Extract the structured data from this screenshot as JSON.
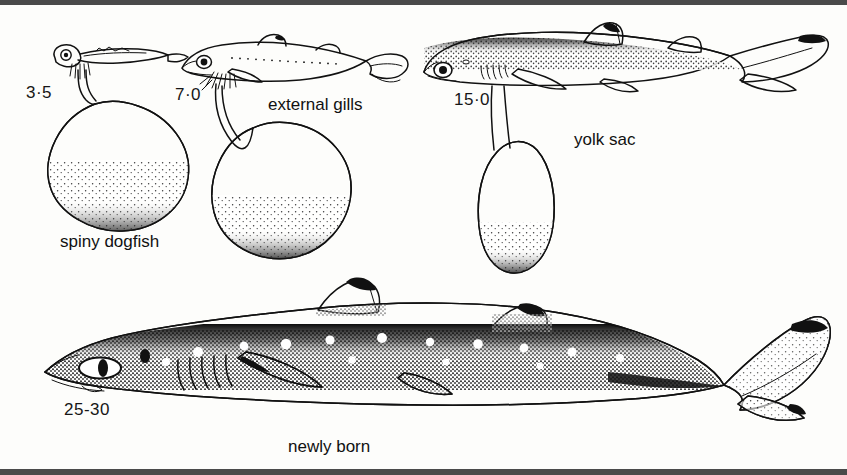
{
  "figure": {
    "subject": "spiny dogfish",
    "background_color": "#fdfdfb",
    "ink_color": "#111111",
    "border_color": "#4a4a4a"
  },
  "stages": [
    {
      "id": "stage-3-5",
      "size_label": "3·5",
      "description": "earliest embryo with large rounded yolk sac"
    },
    {
      "id": "stage-7-0",
      "size_label": "7·0",
      "description": "embryo with external gill filaments and pear-shaped yolk sac"
    },
    {
      "id": "stage-15-0",
      "size_label": "15·0",
      "description": "advanced embryo with reduced elongate yolk sac"
    },
    {
      "id": "stage-25-30",
      "size_label": "25-30",
      "description": "newly born dogfish, yolk sac absorbed"
    }
  ],
  "annotations": {
    "species_caption": "spiny dogfish",
    "external_gills": "external gills",
    "yolk_sac": "yolk sac",
    "newly_born": "newly born"
  }
}
